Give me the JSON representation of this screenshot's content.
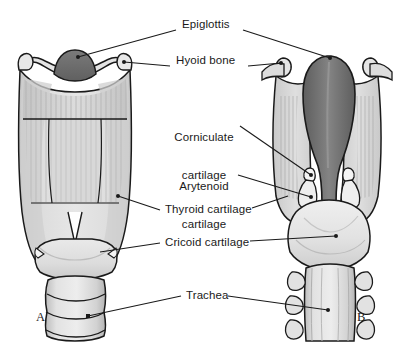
{
  "figure": {
    "background": "#ffffff",
    "line_color": "#1a1a1a",
    "labels": [
      {
        "id": "epiglottis",
        "text": "Epiglottis",
        "x": 182,
        "y": 24,
        "align": "left"
      },
      {
        "id": "hyoid-bone",
        "text": "Hyoid bone",
        "x": 176,
        "y": 60,
        "align": "left"
      },
      {
        "id": "corniculate-cartilage",
        "line1": "Corniculate",
        "line2": "cartilage",
        "x": 176,
        "y": 112,
        "align": "center"
      },
      {
        "id": "arytenoid-cartilage",
        "line1": "Arytenoid",
        "line2": "cartilage",
        "x": 176,
        "y": 161,
        "align": "center"
      },
      {
        "id": "thyroid-cartilage",
        "text": "Thyroid cartilage",
        "x": 165,
        "y": 208,
        "align": "left"
      },
      {
        "id": "cricoid-cartilage",
        "text": "Cricoid cartilage",
        "x": 165,
        "y": 241,
        "align": "left"
      },
      {
        "id": "trachea",
        "text": "Trachea",
        "x": 186,
        "y": 293,
        "align": "left"
      }
    ],
    "panels": [
      {
        "id": "panel-a",
        "text": "A",
        "x": 36,
        "y": 316
      },
      {
        "id": "panel-b",
        "text": "B",
        "x": 357,
        "y": 316
      }
    ],
    "views": {
      "a": {
        "caption": "A",
        "description": "anterior view of larynx"
      },
      "b": {
        "caption": "B",
        "description": "posterior view of larynx"
      }
    },
    "colors": {
      "outline": "#1a1a1a",
      "cartilage_light": "#d9d9d9",
      "cartilage_mid": "#c2c2c2",
      "cartilage_pale": "#e8e8e8",
      "membrane": "#cfcfcf",
      "epiglottis_anterior": "#6f6f6f",
      "epiglottis_posterior": "#686868",
      "epiglottis_highlight": "#7d7d7d",
      "corniculate": "#f2f2f2",
      "trachea_ring": "#d2d2d2",
      "shadow": "#a8a8a8"
    }
  }
}
